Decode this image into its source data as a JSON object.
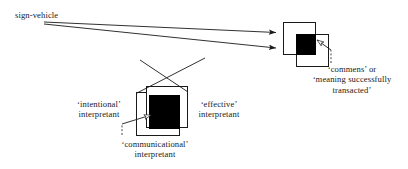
{
  "diagram": {
    "title_text": "sign-vehicle",
    "labels": {
      "sign_vehicle": "sign-vehicle",
      "intentional_line1": "‘intentional’",
      "intentional_line2": "interpretant",
      "effective_line1": "‘effective’",
      "effective_line2": "interpretant",
      "communicational_line1": "‘communicational’",
      "communicational_line2": "interpretant",
      "commens_line1": "‘commens’ or",
      "commens_line2": "‘meaning successfully",
      "commens_line3": "transacted’"
    },
    "colors": {
      "ink": "#1a1a1a",
      "fill_black": "#000000",
      "fill_white": "#ffffff",
      "background": "#ffffff"
    },
    "nodes": [
      {
        "name": "left-cluster",
        "description": "overlapping squares representing intentional / communicational / effective interpretants",
        "outer_box": {
          "x": 136,
          "y": 92,
          "w": 44,
          "h": 44
        },
        "inner_box": {
          "x": 146,
          "y": 86,
          "w": 42,
          "h": 42
        },
        "black_square": {
          "x": 149,
          "y": 95,
          "w": 31,
          "h": 34
        }
      },
      {
        "name": "right-cluster",
        "description": "overlapping squares representing the commens",
        "white_box": {
          "x": 283,
          "y": 22,
          "w": 33,
          "h": 33
        },
        "outline_box": {
          "x": 296,
          "y": 34,
          "w": 33,
          "h": 33
        },
        "black_square": {
          "x": 296,
          "y": 34,
          "w": 21,
          "h": 21
        }
      }
    ],
    "arrows": [
      {
        "name": "sign-vehicle-to-commens-upper",
        "style": "solid",
        "head": "filled",
        "from": [
          44,
          22
        ],
        "to": [
          282,
          33
        ]
      },
      {
        "name": "sign-vehicle-to-commens-lower",
        "style": "solid",
        "head": "filled",
        "from": [
          44,
          24
        ],
        "to": [
          282,
          48
        ]
      },
      {
        "name": "intentional-to-effective",
        "style": "solid",
        "head": "none",
        "from": [
          137,
          92
        ],
        "to": [
          190,
          64
        ]
      },
      {
        "name": "effective-to-intentional",
        "style": "solid",
        "head": "none",
        "from": [
          188,
          90
        ],
        "to": [
          146,
          62
        ]
      },
      {
        "name": "communicational-dashed-left",
        "style": "dashed",
        "head": "hollow",
        "from": [
          123,
          134
        ],
        "to": [
          153,
          116
        ]
      },
      {
        "name": "commens-dashed-right",
        "style": "dashed",
        "head": "hollow",
        "from": [
          330,
          62
        ],
        "to": [
          312,
          42
        ]
      }
    ]
  }
}
